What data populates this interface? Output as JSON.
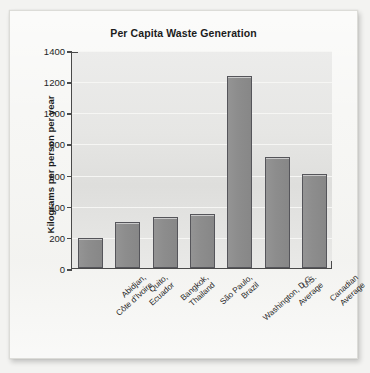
{
  "chart_data": {
    "type": "bar",
    "title": "Per Capita Waste Generation",
    "xlabel": "",
    "ylabel": "Kilograms per person per year",
    "ylim": [
      0,
      1400
    ],
    "ytick_values": [
      0,
      200,
      400,
      600,
      800,
      1000,
      1200,
      1400
    ],
    "ytick_labels": [
      "0",
      "200",
      "400",
      "600",
      "800",
      "1000",
      "1200",
      "1400"
    ],
    "grid": true,
    "legend": null,
    "categories": [
      "Abidjan, Côte d'Ivoire",
      "Quito, Ecuador",
      "Bangkok, Thailand",
      "São Paulo, Brazil",
      "Washington, D.C.",
      "U.S. Average",
      "Canadian Average"
    ],
    "category_lines": [
      [
        "Abidjan,",
        "Côte d'Ivoire"
      ],
      [
        "Quito,",
        "Ecuador"
      ],
      [
        "Bangkok,",
        "Thailand"
      ],
      [
        "São Paulo,",
        "Brazil"
      ],
      [
        "Washington, D.C."
      ],
      [
        "U.S.",
        "Average"
      ],
      [
        "Canadian",
        "Average"
      ]
    ],
    "values": [
      190,
      295,
      325,
      345,
      1230,
      710,
      605
    ],
    "colors": {
      "bar_fill": "#8d8d8d",
      "bar_border": "#55555a",
      "plot_background": "#e6e6e4",
      "gridline": "#f6f6f4",
      "axis": "#4a4a4a",
      "text": "#1f1f1f",
      "page_background": "#f3f3f1",
      "card_background": "#f7f7f5"
    }
  }
}
